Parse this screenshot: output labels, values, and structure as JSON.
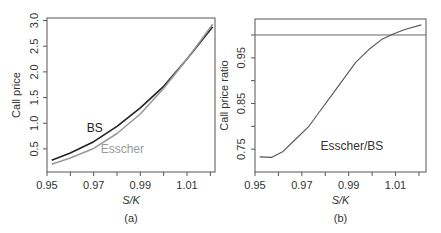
{
  "chart_data": [
    {
      "panel": "(a)",
      "type": "line",
      "title": "",
      "xlabel": "S/K",
      "ylabel": "Call price",
      "xlim": [
        0.95,
        1.022
      ],
      "ylim": [
        0.05,
        3.05
      ],
      "xticks": [
        0.95,
        0.96,
        0.97,
        0.98,
        0.99,
        1.0,
        1.01,
        1.02
      ],
      "xtick_labels": [
        "0.95",
        "",
        "0.97",
        "",
        "0.99",
        "",
        "1.01",
        ""
      ],
      "yticks": [
        0.5,
        1.0,
        1.5,
        2.0,
        2.5,
        3.0
      ],
      "ytick_labels": [
        "0.5",
        "1.0",
        "1.5",
        "2.0",
        "2.5",
        "3.0"
      ],
      "grid": false,
      "caption": "(a)",
      "series": [
        {
          "name": "BS",
          "color": "#222222",
          "x": [
            0.952,
            0.96,
            0.97,
            0.98,
            0.99,
            1.0,
            1.01,
            1.021
          ],
          "y": [
            0.28,
            0.42,
            0.64,
            0.94,
            1.3,
            1.72,
            2.25,
            2.88
          ]
        },
        {
          "name": "Esscher",
          "color": "#9a9a9a",
          "x": [
            0.952,
            0.96,
            0.97,
            0.98,
            0.99,
            1.0,
            1.01,
            1.021
          ],
          "y": [
            0.2,
            0.32,
            0.51,
            0.8,
            1.18,
            1.68,
            2.25,
            2.93
          ]
        }
      ],
      "annotations": [
        {
          "text": "BS",
          "x": 0.967,
          "y": 0.82,
          "color": "#222222"
        },
        {
          "text": "Esscher",
          "x": 0.973,
          "y": 0.42,
          "color": "#9a9a9a"
        }
      ]
    },
    {
      "panel": "(b)",
      "type": "line",
      "title": "",
      "xlabel": "S/K",
      "ylabel": "Call price ratio",
      "xlim": [
        0.95,
        1.023
      ],
      "ylim": [
        0.7,
        1.035
      ],
      "xticks": [
        0.95,
        0.96,
        0.97,
        0.98,
        0.99,
        1.0,
        1.01,
        1.02
      ],
      "xtick_labels": [
        "0.95",
        "",
        "0.97",
        "",
        "0.99",
        "",
        "1.01",
        ""
      ],
      "yticks": [
        0.75,
        0.8,
        0.85,
        0.9,
        0.95,
        1.0
      ],
      "ytick_labels": [
        "0.75",
        "",
        "0.85",
        "",
        "0.95",
        ""
      ],
      "hline": 1.0,
      "grid": false,
      "caption": "(b)",
      "series": [
        {
          "name": "Esscher/BS",
          "color": "#555555",
          "x": [
            0.952,
            0.957,
            0.962,
            0.967,
            0.973,
            0.978,
            0.983,
            0.988,
            0.993,
            0.999,
            1.004,
            1.009,
            1.014,
            1.021
          ],
          "y": [
            0.733,
            0.732,
            0.745,
            0.77,
            0.8,
            0.835,
            0.87,
            0.905,
            0.94,
            0.97,
            0.99,
            1.002,
            1.012,
            1.022
          ]
        }
      ],
      "annotations": [
        {
          "text": "Esscher/BS",
          "x": 0.978,
          "y": 0.748,
          "color": "#333333"
        }
      ]
    }
  ]
}
